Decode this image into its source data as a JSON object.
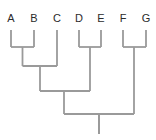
{
  "figure": {
    "name": "cladogram",
    "type": "phylogenetic-tree",
    "style": "rectangular",
    "orientation": "tips-at-top",
    "background_color": "#ffffff",
    "line_color": "#9a9a9a",
    "line_width": 1.8,
    "label_color": "#2b2b2b",
    "label_font_size": 11,
    "width": 156,
    "height": 140
  },
  "chart_data": {
    "type": "diagram",
    "subtype": "cladogram",
    "title": "",
    "newick": "((((A,B),C),(D,E)),(F,G));",
    "taxa": [
      "A",
      "B",
      "C",
      "D",
      "E",
      "F",
      "G"
    ],
    "tips": [
      {
        "label": "A",
        "x": 11,
        "label_x": 11,
        "label_y": 22,
        "tip_y": 30,
        "parent": "AB"
      },
      {
        "label": "B",
        "x": 34,
        "label_x": 34,
        "label_y": 22,
        "tip_y": 30,
        "parent": "AB"
      },
      {
        "label": "C",
        "x": 57,
        "label_x": 57,
        "label_y": 22,
        "tip_y": 30,
        "parent": "ABC"
      },
      {
        "label": "D",
        "x": 79,
        "label_x": 79,
        "label_y": 22,
        "tip_y": 30,
        "parent": "DE"
      },
      {
        "label": "E",
        "x": 101,
        "label_x": 101,
        "label_y": 22,
        "tip_y": 30,
        "parent": "DE"
      },
      {
        "label": "F",
        "x": 123,
        "label_x": 123,
        "label_y": 22,
        "tip_y": 30,
        "parent": "FG"
      },
      {
        "label": "G",
        "x": 146,
        "label_x": 146,
        "label_y": 22,
        "tip_y": 30,
        "parent": "FG"
      }
    ],
    "nodes": [
      {
        "id": "AB",
        "children": [
          "A",
          "B"
        ],
        "x1": 11,
        "x2": 34,
        "y": 47,
        "stem_x": 22.5,
        "stem_to_y": 66
      },
      {
        "id": "DE",
        "children": [
          "D",
          "E"
        ],
        "x1": 79,
        "x2": 101,
        "y": 47,
        "stem_x": 90,
        "stem_to_y": 91
      },
      {
        "id": "FG",
        "children": [
          "F",
          "G"
        ],
        "x1": 123,
        "x2": 146,
        "y": 47,
        "stem_x": 134,
        "stem_to_y": 114
      },
      {
        "id": "ABC",
        "children": [
          "AB",
          "C"
        ],
        "x1": 22.5,
        "x2": 57,
        "y": 66,
        "stem_x": 40,
        "stem_to_y": 91
      },
      {
        "id": "ABCDE",
        "children": [
          "ABC",
          "DE"
        ],
        "x1": 40,
        "x2": 90,
        "y": 91,
        "stem_x": 64,
        "stem_to_y": 114
      },
      {
        "id": "ROOT",
        "children": [
          "ABCDE",
          "FG"
        ],
        "x1": 64,
        "x2": 134,
        "y": 114,
        "stem_x": 99,
        "stem_to_y": 134
      }
    ],
    "root_stem": {
      "x": 99,
      "y_from": 114,
      "y_to": 134
    },
    "clades": [
      {
        "name": "AB",
        "members": [
          "A",
          "B"
        ]
      },
      {
        "name": "ABC",
        "members": [
          "A",
          "B",
          "C"
        ]
      },
      {
        "name": "DE",
        "members": [
          "D",
          "E"
        ]
      },
      {
        "name": "ABCDE",
        "members": [
          "A",
          "B",
          "C",
          "D",
          "E"
        ]
      },
      {
        "name": "FG",
        "members": [
          "F",
          "G"
        ]
      },
      {
        "name": "ROOT",
        "members": [
          "A",
          "B",
          "C",
          "D",
          "E",
          "F",
          "G"
        ]
      }
    ]
  }
}
